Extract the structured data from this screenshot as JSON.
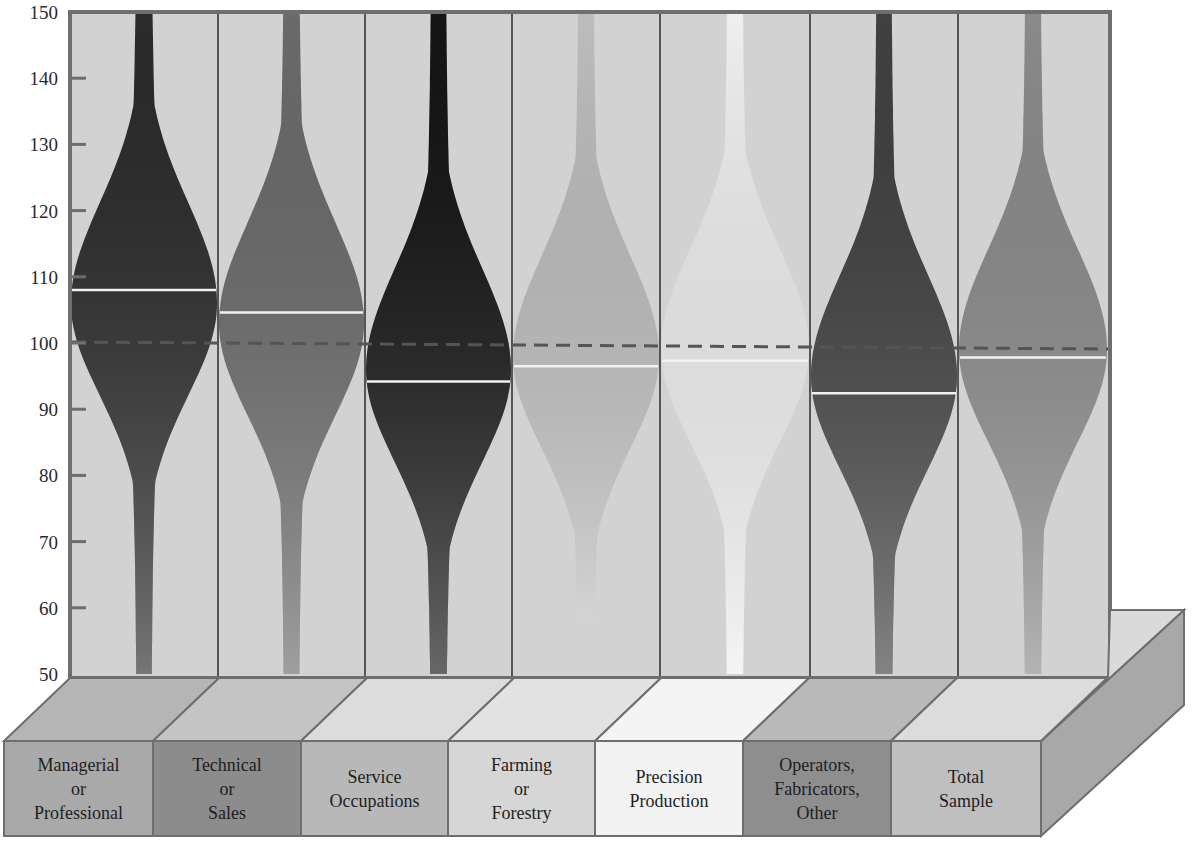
{
  "chart_data": {
    "type": "violin",
    "title": "",
    "xlabel": "",
    "ylabel": "",
    "ylim": [
      50,
      150
    ],
    "yticks": [
      50,
      60,
      70,
      80,
      90,
      100,
      110,
      120,
      130,
      140,
      150
    ],
    "reference_line": {
      "value": 100,
      "style": "dashed",
      "color": "#555555"
    },
    "grid": false,
    "legend": null,
    "categories": [
      "Managerial or Professional",
      "Technical or Sales",
      "Service Occupations",
      "Farming or Forestry",
      "Precision Production",
      "Operators, Fabricators, Other",
      "Total Sample"
    ],
    "series": [
      {
        "name": "Managerial or Professional",
        "label_lines": [
          "Managerial",
          "or",
          "Professional"
        ],
        "mean": 108,
        "min": 50,
        "max": 150,
        "max_half_width_at": 106,
        "fill": "#2b2b2b",
        "box_color": "#a9a9a9",
        "top_color": "#b5b5b5"
      },
      {
        "name": "Technical or Sales",
        "label_lines": [
          "Technical",
          "or",
          "Sales"
        ],
        "mean": 104.6,
        "min": 50,
        "max": 150,
        "max_half_width_at": 103,
        "fill": "#6a6a6a",
        "box_color": "#8c8c8c",
        "top_color": "#c4c4c4"
      },
      {
        "name": "Service Occupations",
        "label_lines": [
          "Service",
          "Occupations"
        ],
        "mean": 94.2,
        "min": 50,
        "max": 150,
        "max_half_width_at": 96,
        "fill": "#151515",
        "box_color": "#b8b8b8",
        "top_color": "#dcdcdc"
      },
      {
        "name": "Farming or Forestry",
        "label_lines": [
          "Farming",
          "or",
          "Forestry"
        ],
        "mean": 96.5,
        "min": 58,
        "max": 150,
        "max_half_width_at": 98,
        "fill": "#bdbdbd",
        "box_color": "#d6d6d6",
        "top_color": "#e2e2e2"
      },
      {
        "name": "Precision Production",
        "label_lines": [
          "Precision",
          "Production"
        ],
        "mean": 97.3,
        "min": 50,
        "max": 150,
        "max_half_width_at": 99,
        "fill": "#efefef",
        "box_color": "#f2f2f2",
        "top_color": "#f4f4f4"
      },
      {
        "name": "Operators, Fabricators, Other",
        "label_lines": [
          "Operators,",
          "Fabricators,",
          "Other"
        ],
        "mean": 92.4,
        "min": 50,
        "max": 150,
        "max_half_width_at": 95,
        "fill": "#404040",
        "box_color": "#8e8e8e",
        "top_color": "#b9b9b9"
      },
      {
        "name": "Total Sample",
        "label_lines": [
          "Total",
          "Sample"
        ],
        "mean": 97.8,
        "min": 50,
        "max": 150,
        "max_half_width_at": 99,
        "fill": "#8a8a8a",
        "box_color": "#bfbfbf",
        "top_color": "#dcdcdc"
      }
    ],
    "background": "#d2d2d2",
    "mean_line_color": "#f2f2f2"
  }
}
